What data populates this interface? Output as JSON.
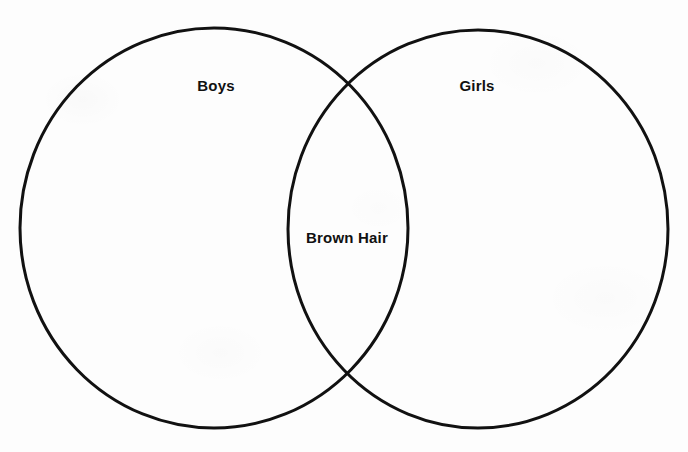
{
  "diagram": {
    "type": "venn",
    "background_color": "#fdfdfd",
    "stroke_color": "#111111",
    "stroke_width": 3,
    "label_color": "#111111",
    "sets": [
      {
        "id": "left-set",
        "label": "Boys",
        "label_x": 216,
        "label_y": 85,
        "circle": {
          "cx": 214,
          "cy": 228,
          "rx": 194,
          "ry": 200
        }
      },
      {
        "id": "right-set",
        "label": "Girls",
        "label_x": 477,
        "label_y": 85,
        "circle": {
          "cx": 478,
          "cy": 229,
          "rx": 190,
          "ry": 199
        }
      }
    ],
    "intersection": {
      "id": "intersection-set",
      "label": "Brown Hair",
      "label_x": 347,
      "label_y": 237,
      "crossing_points": [
        {
          "x": 345,
          "y": 84
        },
        {
          "x": 345,
          "y": 372
        }
      ]
    }
  }
}
